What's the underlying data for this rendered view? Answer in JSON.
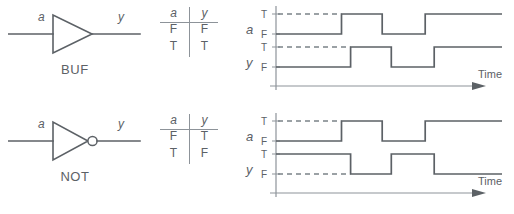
{
  "figure": {
    "line_color": "#5c6166",
    "axis_color": "#8d9399",
    "dash_color": "#7b8288",
    "background": "#ffffff"
  },
  "sections": [
    {
      "id": "buf",
      "gate": {
        "name": "BUF",
        "symbol": "buffer-triangle",
        "input_label": "a",
        "output_label": "y",
        "has_bubble": false
      },
      "truth_table": {
        "headers": [
          "a",
          "y"
        ],
        "rows": [
          [
            "F",
            "F"
          ],
          [
            "T",
            "T"
          ]
        ]
      },
      "waveform": {
        "signals": [
          {
            "name": "a",
            "high_label": "T",
            "low_label": "F",
            "levels": [
              "F",
              "T",
              "F",
              "T"
            ],
            "transitions": [
              0.29,
              0.47,
              0.66
            ]
          },
          {
            "name": "y",
            "high_label": "T",
            "low_label": "F",
            "levels": [
              "F",
              "T",
              "F",
              "T"
            ],
            "transitions": [
              0.33,
              0.51,
              0.7
            ]
          }
        ],
        "axis_label": "Time"
      }
    },
    {
      "id": "not",
      "gate": {
        "name": "NOT",
        "symbol": "inverter-triangle-bubble",
        "input_label": "a",
        "output_label": "y",
        "has_bubble": true
      },
      "truth_table": {
        "headers": [
          "a",
          "y"
        ],
        "rows": [
          [
            "F",
            "T"
          ],
          [
            "T",
            "F"
          ]
        ]
      },
      "waveform": {
        "signals": [
          {
            "name": "a",
            "high_label": "T",
            "low_label": "F",
            "levels": [
              "F",
              "T",
              "F",
              "T"
            ],
            "transitions": [
              0.29,
              0.47,
              0.66
            ]
          },
          {
            "name": "y",
            "high_label": "T",
            "low_label": "F",
            "levels": [
              "T",
              "F",
              "T",
              "F"
            ],
            "transitions": [
              0.33,
              0.51,
              0.7
            ]
          }
        ],
        "axis_label": "Time"
      }
    }
  ]
}
